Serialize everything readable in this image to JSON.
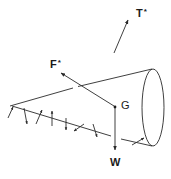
{
  "diagram": {
    "labels": {
      "thrust": "T",
      "thrust_sup": "*",
      "force": "F",
      "force_sup": "*",
      "center": "G",
      "weight": "W"
    },
    "colors": {
      "line": "#2a2a2a",
      "text": "#1a1a1a",
      "background": "#ffffff"
    }
  }
}
